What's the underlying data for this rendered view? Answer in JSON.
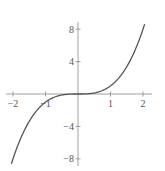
{
  "chart_data": {
    "type": "line",
    "title": "",
    "xlabel": "",
    "ylabel": "",
    "function": "y = x^3",
    "xlim": [
      -2.2,
      2.3
    ],
    "ylim": [
      -8.6,
      8.6
    ],
    "grid": false,
    "legend": null,
    "x_ticks": [
      -2,
      -1,
      1,
      2
    ],
    "y_ticks": [
      8,
      4,
      -4,
      -8
    ],
    "x_tick_labels": [
      "−2",
      "−1",
      "1",
      "2"
    ],
    "y_tick_labels": [
      "8",
      "4",
      "−4",
      "−8"
    ],
    "series": [
      {
        "name": "x^3",
        "x": [
          -2.05,
          -2,
          -1.75,
          -1.5,
          -1.25,
          -1,
          -0.75,
          -0.5,
          -0.25,
          0,
          0.25,
          0.5,
          0.75,
          1,
          1.25,
          1.5,
          1.75,
          2,
          2.05
        ],
        "y": [
          -8.62,
          -8,
          -5.36,
          -3.375,
          -1.95,
          -1,
          -0.42,
          -0.125,
          -0.016,
          0,
          0.016,
          0.125,
          0.42,
          1,
          1.95,
          3.375,
          5.36,
          8,
          8.62
        ]
      }
    ],
    "colors": {
      "curve": "#555555",
      "axes": "#888888"
    }
  }
}
